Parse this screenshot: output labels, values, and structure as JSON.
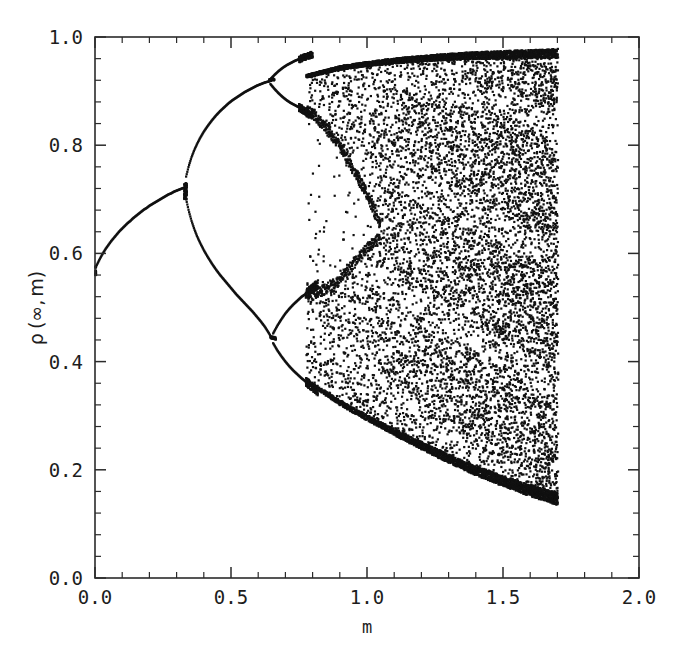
{
  "figure": {
    "kind": "bifurcation-diagram",
    "background": "#ffffff",
    "ink": "#111111"
  },
  "chart_data": {
    "type": "scatter",
    "title": "",
    "xlabel": "m",
    "ylabel": "ρ (∞, m)",
    "ylabel_parts": {
      "rho": "ρ",
      "open": "(",
      "infinity": "∞",
      "comma": ",",
      "m": "m",
      "close": ")"
    },
    "xlim": [
      0.0,
      2.0
    ],
    "ylim": [
      0.0,
      1.0
    ],
    "grid": false,
    "legend": null,
    "xticks": [
      0.0,
      0.5,
      1.0,
      1.5,
      2.0
    ],
    "xtick_labels": [
      "0.0",
      "0.5",
      "1.0",
      "1.5",
      "2.0"
    ],
    "yticks": [
      0.0,
      0.2,
      0.4,
      0.6,
      0.8,
      1.0
    ],
    "ytick_labels": [
      "0.0",
      "0.2",
      "0.4",
      "0.6",
      "0.8",
      "1.0"
    ],
    "x_minor_step": 0.1,
    "y_minor_step": 0.04,
    "tick_direction": "in",
    "marker": "square",
    "marker_size_px": 2.2,
    "data_x_range": [
      0.0,
      1.7
    ],
    "data_y_range": [
      0.135,
      0.978
    ],
    "branches": [
      {
        "name": "period-1 fixed point",
        "m_range": [
          0.0,
          0.33
        ],
        "points": [
          [
            0.0,
            0.572
          ],
          [
            0.01,
            0.582
          ],
          [
            0.02,
            0.592
          ],
          [
            0.03,
            0.601
          ],
          [
            0.04,
            0.609
          ],
          [
            0.05,
            0.616
          ],
          [
            0.06,
            0.623
          ],
          [
            0.07,
            0.629
          ],
          [
            0.08,
            0.635
          ],
          [
            0.09,
            0.641
          ],
          [
            0.1,
            0.646
          ],
          [
            0.11,
            0.651
          ],
          [
            0.12,
            0.656
          ],
          [
            0.13,
            0.66
          ],
          [
            0.14,
            0.665
          ],
          [
            0.15,
            0.669
          ],
          [
            0.16,
            0.673
          ],
          [
            0.17,
            0.677
          ],
          [
            0.18,
            0.681
          ],
          [
            0.19,
            0.684
          ],
          [
            0.2,
            0.688
          ],
          [
            0.21,
            0.691
          ],
          [
            0.22,
            0.694
          ],
          [
            0.23,
            0.697
          ],
          [
            0.24,
            0.7
          ],
          [
            0.25,
            0.703
          ],
          [
            0.26,
            0.706
          ],
          [
            0.27,
            0.709
          ],
          [
            0.28,
            0.711
          ],
          [
            0.29,
            0.714
          ],
          [
            0.3,
            0.716
          ],
          [
            0.31,
            0.718
          ],
          [
            0.32,
            0.72
          ],
          [
            0.33,
            0.722
          ]
        ]
      },
      {
        "name": "period-2 upper",
        "m_range": [
          0.33,
          0.64
        ],
        "points": [
          [
            0.335,
            0.742
          ],
          [
            0.345,
            0.762
          ],
          [
            0.355,
            0.778
          ],
          [
            0.365,
            0.791
          ],
          [
            0.375,
            0.802
          ],
          [
            0.385,
            0.812
          ],
          [
            0.4,
            0.825
          ],
          [
            0.415,
            0.836
          ],
          [
            0.43,
            0.846
          ],
          [
            0.445,
            0.855
          ],
          [
            0.46,
            0.863
          ],
          [
            0.475,
            0.87
          ],
          [
            0.49,
            0.877
          ],
          [
            0.505,
            0.883
          ],
          [
            0.52,
            0.888
          ],
          [
            0.535,
            0.893
          ],
          [
            0.55,
            0.898
          ],
          [
            0.565,
            0.902
          ],
          [
            0.58,
            0.906
          ],
          [
            0.595,
            0.91
          ],
          [
            0.61,
            0.913
          ],
          [
            0.625,
            0.916
          ],
          [
            0.64,
            0.918
          ]
        ]
      },
      {
        "name": "period-2 lower",
        "m_range": [
          0.33,
          0.64
        ],
        "points": [
          [
            0.335,
            0.7
          ],
          [
            0.345,
            0.678
          ],
          [
            0.355,
            0.66
          ],
          [
            0.365,
            0.645
          ],
          [
            0.375,
            0.632
          ],
          [
            0.385,
            0.621
          ],
          [
            0.4,
            0.606
          ],
          [
            0.415,
            0.593
          ],
          [
            0.43,
            0.581
          ],
          [
            0.445,
            0.57
          ],
          [
            0.46,
            0.56
          ],
          [
            0.475,
            0.551
          ],
          [
            0.49,
            0.542
          ],
          [
            0.505,
            0.533
          ],
          [
            0.52,
            0.524
          ],
          [
            0.535,
            0.516
          ],
          [
            0.55,
            0.508
          ],
          [
            0.565,
            0.5
          ],
          [
            0.58,
            0.492
          ],
          [
            0.595,
            0.483
          ],
          [
            0.61,
            0.474
          ],
          [
            0.625,
            0.464
          ],
          [
            0.64,
            0.452
          ],
          [
            0.65,
            0.443
          ]
        ]
      },
      {
        "name": "period-4 branch a (from upper)",
        "m_range": [
          0.64,
          0.8
        ],
        "points": [
          [
            0.645,
            0.922
          ],
          [
            0.66,
            0.93
          ],
          [
            0.675,
            0.937
          ],
          [
            0.69,
            0.943
          ],
          [
            0.705,
            0.948
          ],
          [
            0.72,
            0.952
          ],
          [
            0.735,
            0.956
          ],
          [
            0.75,
            0.959
          ]
        ]
      },
      {
        "name": "period-4 branch b (from upper)",
        "m_range": [
          0.64,
          0.8
        ],
        "points": [
          [
            0.645,
            0.913
          ],
          [
            0.66,
            0.904
          ],
          [
            0.675,
            0.896
          ],
          [
            0.69,
            0.889
          ],
          [
            0.705,
            0.883
          ],
          [
            0.72,
            0.878
          ],
          [
            0.735,
            0.874
          ],
          [
            0.75,
            0.87
          ]
        ]
      },
      {
        "name": "period-4 branch c (from lower)",
        "m_range": [
          0.65,
          0.82
        ],
        "points": [
          [
            0.655,
            0.452
          ],
          [
            0.67,
            0.466
          ],
          [
            0.685,
            0.478
          ],
          [
            0.7,
            0.489
          ],
          [
            0.715,
            0.498
          ],
          [
            0.73,
            0.506
          ],
          [
            0.745,
            0.513
          ],
          [
            0.76,
            0.52
          ],
          [
            0.775,
            0.525
          ]
        ]
      },
      {
        "name": "period-4 branch d (from lower)",
        "m_range": [
          0.65,
          0.82
        ],
        "points": [
          [
            0.655,
            0.434
          ],
          [
            0.67,
            0.421
          ],
          [
            0.685,
            0.41
          ],
          [
            0.7,
            0.4
          ],
          [
            0.715,
            0.391
          ],
          [
            0.73,
            0.383
          ],
          [
            0.745,
            0.376
          ],
          [
            0.76,
            0.369
          ],
          [
            0.775,
            0.363
          ]
        ]
      }
    ],
    "chaotic_band": {
      "m_start": 0.78,
      "m_end": 1.7,
      "upper_envelope": [
        [
          0.78,
          0.93
        ],
        [
          0.9,
          0.946
        ],
        [
          1.0,
          0.954
        ],
        [
          1.1,
          0.96
        ],
        [
          1.2,
          0.965
        ],
        [
          1.3,
          0.969
        ],
        [
          1.4,
          0.972
        ],
        [
          1.5,
          0.974
        ],
        [
          1.6,
          0.976
        ],
        [
          1.7,
          0.978
        ]
      ],
      "lower_envelope": [
        [
          0.78,
          0.36
        ],
        [
          0.9,
          0.32
        ],
        [
          1.0,
          0.291
        ],
        [
          1.1,
          0.264
        ],
        [
          1.2,
          0.238
        ],
        [
          1.3,
          0.213
        ],
        [
          1.4,
          0.19
        ],
        [
          1.5,
          0.17
        ],
        [
          1.6,
          0.151
        ],
        [
          1.7,
          0.135
        ]
      ],
      "internal_gap": {
        "description": "sparse band between the upper chaotic sheet and the lower chaotic sheet, closing near m = 1.05",
        "upper_sheet_bottom": [
          [
            0.8,
            0.85
          ],
          [
            0.9,
            0.79
          ],
          [
            1.0,
            0.7
          ],
          [
            1.05,
            0.64
          ]
        ],
        "lower_sheet_top": [
          [
            0.8,
            0.53
          ],
          [
            0.9,
            0.56
          ],
          [
            1.0,
            0.62
          ],
          [
            1.05,
            0.64
          ]
        ]
      }
    }
  }
}
